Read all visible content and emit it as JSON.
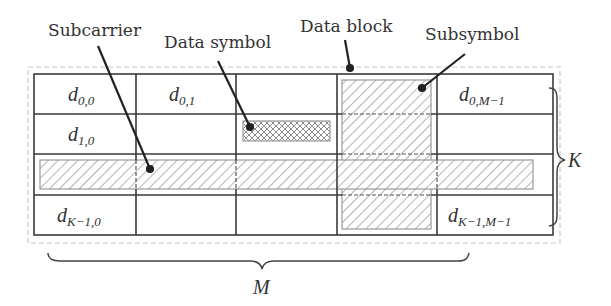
{
  "diagram": {
    "type": "time-frequency resource grid",
    "callouts": {
      "subcarrier": "Subcarrier",
      "data_symbol": "Data symbol",
      "data_block": "Data block",
      "subsymbol": "Subsymbol"
    },
    "cells": {
      "r0c0": {
        "base": "d",
        "sub": "0,0"
      },
      "r0c1": {
        "base": "d",
        "sub": "0,1"
      },
      "r0c4": {
        "base": "d",
        "sub": "0,M−1"
      },
      "r1c0": {
        "base": "d",
        "sub": "1,0"
      },
      "r3c0": {
        "base": "d",
        "sub": "K−1,0"
      },
      "r3c4": {
        "base": "d",
        "sub": "K−1,M−1"
      }
    },
    "braces": {
      "rows": "K",
      "cols": "M"
    },
    "grid": {
      "rows": 4,
      "cols": 5,
      "line_color": "#3a3a3a",
      "hatch_color": "#9a9a9a",
      "dashed_color": "#c8c8c8"
    }
  }
}
